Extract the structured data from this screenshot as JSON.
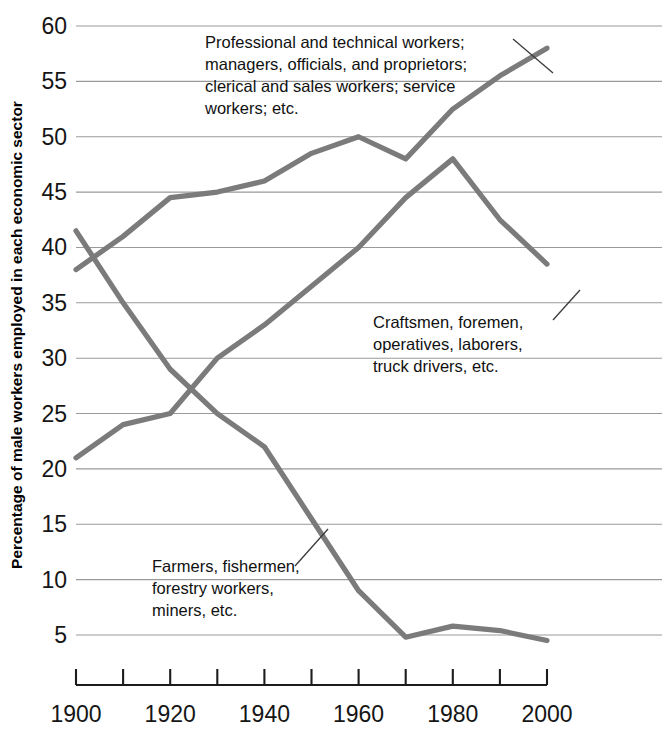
{
  "chart_data": {
    "type": "line",
    "title": "",
    "xlabel": "",
    "ylabel": "Percentage of male workers employed in each economic sector",
    "x": [
      1900,
      1910,
      1920,
      1930,
      1940,
      1950,
      1960,
      1970,
      1980,
      1990,
      2000
    ],
    "xlim": [
      1900,
      2000
    ],
    "ylim": [
      5,
      60
    ],
    "y_ticks": [
      5,
      10,
      15,
      20,
      25,
      30,
      35,
      40,
      45,
      50,
      55,
      60
    ],
    "x_ticks": [
      1900,
      1910,
      1920,
      1930,
      1940,
      1950,
      1960,
      1970,
      1980,
      1990,
      2000
    ],
    "x_tick_labels_shown": [
      "1900",
      "1920",
      "1940",
      "1960",
      "1980",
      "2000"
    ],
    "grid": true,
    "legend": "inline annotations",
    "series": [
      {
        "name": "Professional and technical workers; managers, officials, and proprietors; clerical and sales workers; service workers; etc.",
        "short_name": "white-collar",
        "color": "#7b7b7b",
        "values": [
          38,
          41,
          44.5,
          45,
          46,
          48.5,
          50,
          48,
          52.5,
          55.5,
          58
        ]
      },
      {
        "name": "Craftsmen, foremen, operatives, laborers, truck drivers, etc.",
        "short_name": "blue-collar",
        "color": "#7b7b7b",
        "values": [
          21,
          24,
          25,
          30,
          33,
          36.5,
          40,
          44.5,
          48,
          42.5,
          38.5
        ]
      },
      {
        "name": "Farmers, fishermen, forestry workers, miners, etc.",
        "short_name": "agricultural",
        "color": "#7b7b7b",
        "values": [
          41.5,
          35,
          29,
          25,
          22,
          15.5,
          9,
          4.8,
          5.8,
          5.4,
          4.5
        ]
      }
    ]
  },
  "axis": {
    "y_title": "Percentage of male workers employed in each economic sector",
    "y_tick_labels": [
      "60",
      "55",
      "50",
      "45",
      "40",
      "35",
      "30",
      "25",
      "20",
      "15",
      "10",
      "5"
    ],
    "x_tick_labels": [
      "1900",
      "1920",
      "1940",
      "1960",
      "1980",
      "2000"
    ]
  },
  "annotations": {
    "white_collar": {
      "lines": [
        "Professional and technical workers;",
        "managers, officials, and proprietors;",
        "clerical and sales workers; service",
        "workers; etc."
      ]
    },
    "blue_collar": {
      "lines": [
        "Craftsmen, foremen,",
        "operatives, laborers,",
        "truck drivers, etc."
      ]
    },
    "agricultural": {
      "lines": [
        "Farmers, fishermen,",
        "forestry workers,",
        "miners, etc."
      ]
    }
  },
  "colors": {
    "line": "#7b7b7b",
    "grid": "#9a9a9a",
    "axis": "#1c1c1c",
    "text": "#111111",
    "background": "#ffffff"
  }
}
